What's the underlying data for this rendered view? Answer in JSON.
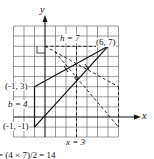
{
  "axes": {
    "x_label": "x",
    "y_label": "y"
  },
  "points": [
    {
      "label": "(6, 7)",
      "x": 6,
      "y": 7
    },
    {
      "label": "(-1, 3)",
      "x": -1,
      "y": 3
    },
    {
      "label": "(-1, -1)",
      "x": -1,
      "y": -1
    }
  ],
  "annotations": {
    "height": "h = 7",
    "base": "b = 4",
    "vertical_line": "x = 3",
    "formula": "= (4 × 7)/2 = 14"
  },
  "colors": {
    "grid": "#444444",
    "lines": "#111111"
  }
}
